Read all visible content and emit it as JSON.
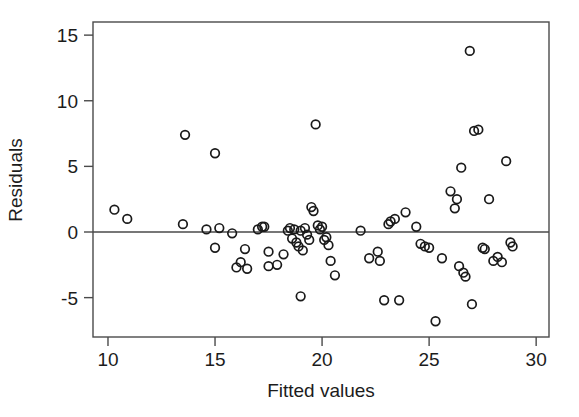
{
  "chart_data": {
    "type": "scatter",
    "title": "",
    "xlabel": "Fitted values",
    "ylabel": "Residuals",
    "xlim": [
      9.3,
      30.6
    ],
    "ylim": [
      -8.0,
      16.0
    ],
    "xticks": [
      10,
      15,
      20,
      25,
      30
    ],
    "xtick_labels": [
      "10",
      "15",
      "20",
      "25",
      "30"
    ],
    "yticks": [
      -5,
      0,
      5,
      10,
      15
    ],
    "ytick_labels": [
      "-5",
      "0",
      "5",
      "10",
      "15"
    ],
    "grid": false,
    "legend": "none",
    "reference_line": {
      "type": "horizontal",
      "y": 0
    },
    "marker": {
      "shape": "open-circle",
      "radius": 4.3,
      "color": "#1a1a1a",
      "fill": "none"
    },
    "points": [
      [
        10.3,
        1.7
      ],
      [
        10.9,
        1.0
      ],
      [
        13.6,
        7.4
      ],
      [
        13.5,
        0.6
      ],
      [
        14.6,
        0.2
      ],
      [
        15.0,
        6.0
      ],
      [
        15.0,
        -1.2
      ],
      [
        15.2,
        0.3
      ],
      [
        15.8,
        -0.1
      ],
      [
        16.0,
        -2.7
      ],
      [
        16.2,
        -2.3
      ],
      [
        16.4,
        -1.3
      ],
      [
        16.5,
        -2.8
      ],
      [
        17.0,
        0.2
      ],
      [
        17.2,
        0.4
      ],
      [
        17.3,
        0.4
      ],
      [
        17.5,
        -2.6
      ],
      [
        17.5,
        -1.5
      ],
      [
        17.9,
        -2.5
      ],
      [
        18.2,
        -1.7
      ],
      [
        18.4,
        0.1
      ],
      [
        18.5,
        0.3
      ],
      [
        18.6,
        -0.5
      ],
      [
        18.7,
        0.2
      ],
      [
        18.8,
        -0.8
      ],
      [
        18.9,
        -1.1
      ],
      [
        19.0,
        0.1
      ],
      [
        19.1,
        -1.4
      ],
      [
        19.2,
        0.3
      ],
      [
        19.3,
        -0.2
      ],
      [
        19.4,
        -0.6
      ],
      [
        19.0,
        -4.9
      ],
      [
        19.5,
        1.9
      ],
      [
        19.6,
        1.6
      ],
      [
        19.7,
        8.2
      ],
      [
        19.8,
        0.5
      ],
      [
        19.9,
        0.2
      ],
      [
        20.0,
        0.4
      ],
      [
        20.1,
        -0.6
      ],
      [
        20.2,
        -0.4
      ],
      [
        20.3,
        -1.0
      ],
      [
        20.4,
        -2.2
      ],
      [
        20.6,
        -3.3
      ],
      [
        21.8,
        0.1
      ],
      [
        22.2,
        -2.0
      ],
      [
        22.6,
        -1.5
      ],
      [
        22.7,
        -2.2
      ],
      [
        22.9,
        -5.2
      ],
      [
        23.1,
        0.6
      ],
      [
        23.2,
        0.8
      ],
      [
        23.4,
        1.0
      ],
      [
        23.6,
        -5.2
      ],
      [
        23.9,
        1.5
      ],
      [
        24.4,
        0.4
      ],
      [
        24.6,
        -0.9
      ],
      [
        24.8,
        -1.1
      ],
      [
        25.0,
        -1.2
      ],
      [
        25.3,
        -6.8
      ],
      [
        25.6,
        -2.0
      ],
      [
        26.0,
        3.1
      ],
      [
        26.2,
        1.8
      ],
      [
        26.3,
        2.5
      ],
      [
        26.4,
        -2.6
      ],
      [
        26.5,
        4.9
      ],
      [
        26.6,
        -3.1
      ],
      [
        26.7,
        -3.4
      ],
      [
        26.9,
        13.8
      ],
      [
        27.0,
        -5.5
      ],
      [
        27.1,
        7.7
      ],
      [
        27.3,
        7.8
      ],
      [
        27.5,
        -1.2
      ],
      [
        27.6,
        -1.3
      ],
      [
        27.8,
        2.5
      ],
      [
        28.0,
        -2.2
      ],
      [
        28.2,
        -1.9
      ],
      [
        28.4,
        -2.3
      ],
      [
        28.6,
        5.4
      ],
      [
        28.8,
        -0.8
      ],
      [
        28.9,
        -1.1
      ]
    ]
  },
  "axis": {
    "x_title": "Fitted values",
    "y_title": "Residuals"
  }
}
